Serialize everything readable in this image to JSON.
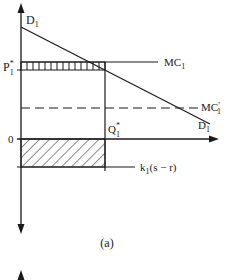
{
  "diagram": {
    "caption": "(a)",
    "colors": {
      "ink": "#1a1a1a",
      "background": "#ffffff"
    },
    "labels": {
      "demand_top": {
        "main": "D",
        "sub": "1"
      },
      "demand_bottom": {
        "main": "D",
        "sub": "1"
      },
      "price": {
        "main": "P",
        "sup": "*",
        "sub": "1"
      },
      "mc": {
        "main": "MC",
        "sub": "1"
      },
      "mc_prime": {
        "main": "MC",
        "prime": "′",
        "sub": "1"
      },
      "quantity": {
        "main": "Q",
        "sup": "*",
        "sub": "1"
      },
      "origin": "0",
      "subsidy": {
        "main": "k",
        "sub": "1",
        "rest": "(s − r)"
      }
    },
    "elements": {
      "vertical_axis": "bidirectional arrow",
      "horizontal_axis": "arrow right",
      "demand_curve": "D1 downward sloping line",
      "mc_line": "MC1 solid horizontal",
      "mc_prime_line": "MC'1 dashed horizontal",
      "upper_region": "vertical-line hatched rectangle between MC1 and P1*",
      "lower_region": "diagonal-hatched rectangle between 0 and k1(s-r)"
    }
  }
}
